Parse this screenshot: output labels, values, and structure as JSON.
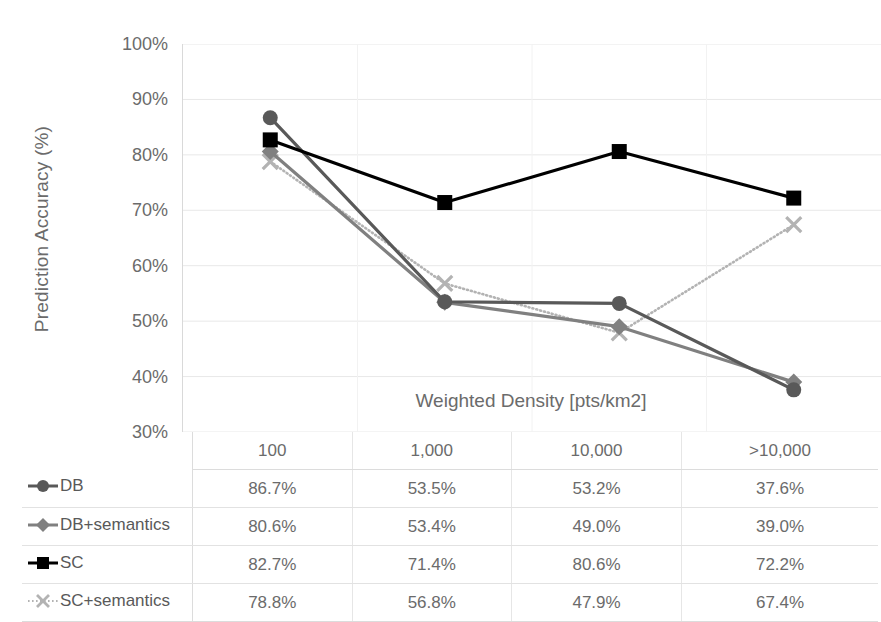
{
  "chart_data": {
    "type": "line",
    "title": "",
    "xlabel": "Weighted Density [pts/km2]",
    "ylabel": "Prediction Accuracy (%)",
    "categories": [
      "100",
      "1,000",
      "10,000",
      ">10,000"
    ],
    "yticks": [
      "30%",
      "40%",
      "50%",
      "60%",
      "70%",
      "80%",
      "90%",
      "100%"
    ],
    "ylim": [
      30,
      100
    ],
    "grid": true,
    "legend_position": "table-left",
    "series": [
      {
        "name": "DB",
        "marker": "circle",
        "color": "#595959",
        "linestyle": "solid",
        "values": [
          86.7,
          53.5,
          53.2,
          37.6
        ],
        "labels": [
          "86.7%",
          "53.5%",
          "53.2%",
          "37.6%"
        ]
      },
      {
        "name": "DB+semantics",
        "marker": "diamond",
        "color": "#808080",
        "linestyle": "solid",
        "values": [
          80.6,
          53.4,
          49.0,
          39.0
        ],
        "labels": [
          "80.6%",
          "53.4%",
          "49.0%",
          "39.0%"
        ]
      },
      {
        "name": "SC",
        "marker": "square",
        "color": "#000000",
        "linestyle": "solid",
        "values": [
          82.7,
          71.4,
          80.6,
          72.2
        ],
        "labels": [
          "82.7%",
          "71.4%",
          "80.6%",
          "72.2%"
        ]
      },
      {
        "name": "SC+semantics",
        "marker": "cross",
        "color": "#b3b3b3",
        "linestyle": "dotted",
        "values": [
          78.8,
          56.8,
          47.9,
          67.4
        ],
        "labels": [
          "78.8%",
          "56.8%",
          "47.9%",
          "67.4%"
        ]
      }
    ]
  },
  "colors": {
    "gridline": "#e8e8e8",
    "axis": "#d9d9d9",
    "text": "#6b6b6b",
    "table_border": "#dcdcdc",
    "background": "#ffffff"
  }
}
